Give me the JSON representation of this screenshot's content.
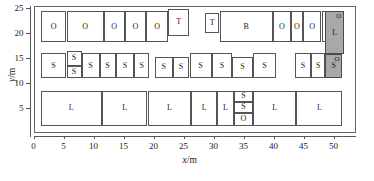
{
  "figure": {
    "type": "layout-diagram",
    "background": "#ffffff",
    "shaded_color": "#a8a8a8",
    "line_color": "#555555"
  },
  "chart_data": {
    "type": "table",
    "title": "",
    "subtitle": "",
    "xlabel": "x/m",
    "ylabel": "y/m",
    "xlim": [
      0,
      53.7
    ],
    "ylim": [
      0,
      25.4
    ],
    "xticks": [
      0,
      5,
      10,
      15,
      20,
      25,
      30,
      35,
      40,
      45,
      50
    ],
    "yticks": [
      5,
      10,
      15,
      20,
      25
    ],
    "grid": false,
    "legend": null,
    "annotations": [],
    "rows": [
      {
        "name": "top-row",
        "y0": 18.2,
        "y1": 24.4,
        "items": [
          {
            "label": "O",
            "x0": 1.2,
            "x1": 5.5,
            "y0": 18.2,
            "y1": 24.4,
            "shaded": false
          },
          {
            "label": "O",
            "x0": 5.5,
            "x1": 11.7,
            "y0": 18.2,
            "y1": 24.4,
            "shaded": false
          },
          {
            "label": "O",
            "x0": 11.7,
            "x1": 15.2,
            "y0": 18.2,
            "y1": 24.4,
            "shaded": false
          },
          {
            "label": "O",
            "x0": 15.2,
            "x1": 18.8,
            "y0": 18.2,
            "y1": 24.4,
            "shaded": false
          },
          {
            "label": "O",
            "x0": 18.8,
            "x1": 22.4,
            "y0": 18.2,
            "y1": 24.4,
            "shaded": false
          },
          {
            "label": "T",
            "x0": 22.4,
            "x1": 26.0,
            "y0": 19.4,
            "y1": 24.9,
            "shaded": false
          },
          {
            "label": "T",
            "x0": 28.6,
            "x1": 31.0,
            "y0": 20.0,
            "y1": 24.0,
            "shaded": false
          },
          {
            "label": "B",
            "x0": 31.0,
            "x1": 39.9,
            "y0": 18.2,
            "y1": 24.4,
            "shaded": false
          },
          {
            "label": "O",
            "x0": 39.9,
            "x1": 42.9,
            "y0": 18.2,
            "y1": 24.4,
            "shaded": false
          },
          {
            "label": "O",
            "x0": 42.9,
            "x1": 44.9,
            "y0": 18.2,
            "y1": 24.4,
            "shaded": false
          },
          {
            "label": "O",
            "x0": 44.9,
            "x1": 48.0,
            "y0": 18.2,
            "y1": 24.4,
            "shaded": false
          },
          {
            "label": "O",
            "x0": 48.0,
            "x1": 51.5,
            "y0": 18.2,
            "y1": 24.4,
            "shaded": false
          }
        ]
      },
      {
        "name": "middle-row",
        "y0": 11.0,
        "y1": 16.0,
        "items": [
          {
            "label": "S",
            "x0": 1.2,
            "x1": 5.5,
            "y0": 11.0,
            "y1": 16.0,
            "shaded": false
          },
          {
            "label": "S",
            "x0": 5.5,
            "x1": 8.0,
            "y0": 13.5,
            "y1": 16.4,
            "shaded": false
          },
          {
            "label": "S",
            "x0": 5.5,
            "x1": 8.0,
            "y0": 11.0,
            "y1": 13.5,
            "shaded": false
          },
          {
            "label": "S",
            "x0": 8.0,
            "x1": 11.0,
            "y0": 11.0,
            "y1": 16.0,
            "shaded": false
          },
          {
            "label": "S",
            "x0": 11.0,
            "x1": 13.7,
            "y0": 11.0,
            "y1": 16.0,
            "shaded": false
          },
          {
            "label": "S",
            "x0": 13.7,
            "x1": 16.8,
            "y0": 11.0,
            "y1": 16.0,
            "shaded": false
          },
          {
            "label": "S",
            "x0": 16.8,
            "x1": 19.3,
            "y0": 11.0,
            "y1": 16.0,
            "shaded": false
          },
          {
            "label": "S",
            "x0": 20.2,
            "x1": 23.2,
            "y0": 11.0,
            "y1": 15.3,
            "shaded": false
          },
          {
            "label": "S",
            "x0": 23.2,
            "x1": 26.0,
            "y0": 11.0,
            "y1": 15.3,
            "shaded": false
          },
          {
            "label": "S",
            "x0": 26.0,
            "x1": 29.7,
            "y0": 11.0,
            "y1": 16.0,
            "shaded": false
          },
          {
            "label": "S",
            "x0": 29.7,
            "x1": 33.1,
            "y0": 11.0,
            "y1": 16.0,
            "shaded": false
          },
          {
            "label": "S",
            "x0": 33.1,
            "x1": 36.6,
            "y0": 11.0,
            "y1": 15.3,
            "shaded": false
          },
          {
            "label": "S",
            "x0": 36.6,
            "x1": 40.4,
            "y0": 11.0,
            "y1": 16.0,
            "shaded": false
          },
          {
            "label": "S",
            "x0": 43.5,
            "x1": 46.3,
            "y0": 11.0,
            "y1": 16.0,
            "shaded": false
          },
          {
            "label": "S",
            "x0": 46.3,
            "x1": 48.6,
            "y0": 11.0,
            "y1": 16.0,
            "shaded": false
          },
          {
            "label": "S",
            "x0": 48.6,
            "x1": 51.5,
            "y0": 11.0,
            "y1": 15.8,
            "shaded": true,
            "sup": "O"
          }
        ]
      },
      {
        "name": "bottom-row",
        "y0": 1.5,
        "y1": 8.5,
        "items": [
          {
            "label": "L",
            "x0": 1.2,
            "x1": 11.4,
            "y0": 1.5,
            "y1": 8.5,
            "shaded": false
          },
          {
            "label": "L",
            "x0": 11.4,
            "x1": 19.0,
            "y0": 1.5,
            "y1": 8.5,
            "shaded": false
          },
          {
            "label": "L",
            "x0": 19.0,
            "x1": 26.3,
            "y0": 1.5,
            "y1": 8.5,
            "shaded": false
          },
          {
            "label": "L",
            "x0": 26.3,
            "x1": 30.6,
            "y0": 1.5,
            "y1": 8.5,
            "shaded": false
          },
          {
            "label": "L",
            "x0": 30.6,
            "x1": 33.4,
            "y0": 1.5,
            "y1": 8.5,
            "shaded": false
          },
          {
            "label": "S",
            "x0": 33.4,
            "x1": 36.6,
            "y0": 6.3,
            "y1": 8.5,
            "shaded": false
          },
          {
            "label": "S",
            "x0": 33.4,
            "x1": 36.6,
            "y0": 4.0,
            "y1": 6.3,
            "shaded": false
          },
          {
            "label": "O",
            "x0": 33.4,
            "x1": 36.6,
            "y0": 1.5,
            "y1": 4.0,
            "shaded": false
          },
          {
            "label": "L",
            "x0": 36.6,
            "x1": 43.8,
            "y0": 1.5,
            "y1": 8.5,
            "shaded": false
          },
          {
            "label": "L",
            "x0": 43.8,
            "x1": 51.5,
            "y0": 1.5,
            "y1": 8.5,
            "shaded": false
          }
        ]
      },
      {
        "name": "shaded-right-column",
        "y0": 15.8,
        "y1": 24.4,
        "items": [
          {
            "label": "L",
            "x0": 48.6,
            "x1": 51.8,
            "y0": 15.8,
            "y1": 24.4,
            "shaded": true,
            "sup": "O"
          }
        ]
      }
    ]
  }
}
